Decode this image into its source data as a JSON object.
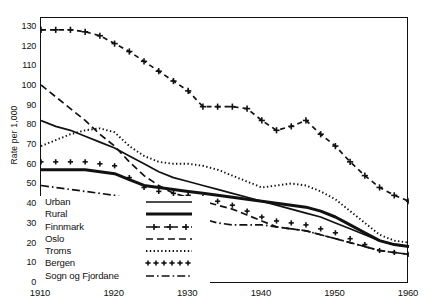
{
  "chart_data": {
    "type": "line",
    "title": "",
    "xlabel": "",
    "ylabel": "Rate per 1,000",
    "xlim": [
      1910,
      1960
    ],
    "ylim": [
      0,
      135
    ],
    "ytick_step": 10,
    "xtick_step": 10,
    "yticks": [
      0,
      10,
      20,
      30,
      40,
      50,
      60,
      70,
      80,
      90,
      100,
      110,
      120,
      130
    ],
    "xticks": [
      1910,
      1920,
      1930,
      1940,
      1950,
      1960
    ],
    "grid": false,
    "legend_position": "lower-left-inside",
    "series": [
      {
        "name": "Urban",
        "style": "solid-thin",
        "x": [
          1910,
          1912,
          1914,
          1916,
          1918,
          1920,
          1922,
          1924,
          1926,
          1928,
          1930,
          1932,
          1934,
          1936,
          1938,
          1940,
          1942,
          1944,
          1946,
          1948,
          1950,
          1952,
          1954,
          1956,
          1958,
          1960
        ],
        "values": [
          83,
          80,
          78,
          75,
          72,
          69,
          65,
          61,
          57,
          54,
          52,
          50,
          48,
          46,
          44,
          42,
          40,
          38,
          36,
          34,
          31,
          28,
          25,
          22,
          20,
          19
        ]
      },
      {
        "name": "Rural",
        "style": "solid-thick",
        "x": [
          1910,
          1912,
          1914,
          1916,
          1918,
          1920,
          1922,
          1924,
          1926,
          1928,
          1930,
          1932,
          1934,
          1936,
          1938,
          1940,
          1942,
          1944,
          1946,
          1948,
          1950,
          1952,
          1954,
          1956,
          1958,
          1960
        ],
        "values": [
          58,
          58,
          58,
          58,
          57,
          56,
          53,
          50,
          49,
          48,
          47,
          46,
          45,
          44,
          43,
          42,
          41,
          40,
          39,
          37,
          34,
          30,
          26,
          22,
          20,
          19
        ]
      },
      {
        "name": "Finnmark",
        "style": "dash-plus",
        "x": [
          1910,
          1912,
          1914,
          1916,
          1918,
          1920,
          1922,
          1924,
          1926,
          1928,
          1930,
          1932,
          1934,
          1936,
          1938,
          1940,
          1942,
          1944,
          1946,
          1948,
          1950,
          1952,
          1954,
          1956,
          1958,
          1960
        ],
        "values": [
          129,
          129,
          129,
          128,
          126,
          122,
          118,
          113,
          108,
          103,
          98,
          90,
          90,
          90,
          89,
          83,
          78,
          80,
          83,
          76,
          70,
          62,
          55,
          49,
          45,
          42
        ]
      },
      {
        "name": "Oslo",
        "style": "dashed",
        "x": [
          1910,
          1912,
          1914,
          1916,
          1918,
          1920,
          1922,
          1924,
          1926,
          1928,
          1930,
          1932,
          1934,
          1936,
          1938,
          1940,
          1942,
          1944,
          1946,
          1948,
          1950,
          1952,
          1954,
          1956,
          1958,
          1960
        ],
        "values": [
          101,
          95,
          89,
          83,
          76,
          70,
          62,
          55,
          50,
          46,
          44,
          42,
          40,
          38,
          35,
          32,
          29,
          28,
          27,
          25,
          23,
          21,
          19,
          17,
          16,
          15
        ]
      },
      {
        "name": "Troms",
        "style": "dotted",
        "x": [
          1910,
          1912,
          1914,
          1916,
          1918,
          1920,
          1922,
          1924,
          1926,
          1928,
          1930,
          1932,
          1934,
          1936,
          1938,
          1940,
          1942,
          1944,
          1946,
          1948,
          1950,
          1952,
          1954,
          1956,
          1958,
          1960
        ],
        "values": [
          70,
          73,
          76,
          78,
          79,
          77,
          70,
          65,
          62,
          61,
          61,
          60,
          58,
          55,
          52,
          49,
          50,
          51,
          50,
          47,
          43,
          37,
          31,
          25,
          22,
          21
        ]
      },
      {
        "name": "Bergen",
        "style": "plus-marks",
        "x": [
          1910,
          1912,
          1914,
          1916,
          1918,
          1920,
          1922,
          1924,
          1926,
          1928,
          1930,
          1932,
          1934,
          1936,
          1938,
          1940,
          1942,
          1944,
          1946,
          1948,
          1950,
          1952,
          1954,
          1956,
          1958,
          1960
        ],
        "values": [
          62,
          62,
          62,
          62,
          61,
          60,
          54,
          49,
          47,
          46,
          45,
          44,
          42,
          40,
          37,
          34,
          32,
          31,
          30,
          28,
          26,
          23,
          20,
          17,
          16,
          15
        ]
      },
      {
        "name": "Sogn og Fjordane",
        "style": "dash-dot",
        "x": [
          1910,
          1912,
          1914,
          1916,
          1918,
          1920,
          1922,
          1924,
          1926,
          1928,
          1930,
          1932,
          1934,
          1936,
          1938,
          1940,
          1942,
          1944,
          1946,
          1948,
          1950,
          1952,
          1954,
          1956,
          1958,
          1960
        ],
        "values": [
          50,
          49,
          48,
          47,
          46,
          45,
          43,
          41,
          39,
          37,
          35,
          33,
          31,
          30,
          30,
          30,
          29,
          28,
          27,
          25,
          23,
          21,
          19,
          17,
          16,
          15
        ]
      }
    ]
  },
  "legend": {
    "items": [
      {
        "label": "Urban",
        "style": "solid-thin"
      },
      {
        "label": "Rural",
        "style": "solid-thick"
      },
      {
        "label": "Finnmark",
        "style": "dash-plus"
      },
      {
        "label": "Oslo",
        "style": "dashed"
      },
      {
        "label": "Troms",
        "style": "dotted"
      },
      {
        "label": "Bergen",
        "style": "plus-marks"
      },
      {
        "label": "Sogn og Fjordane",
        "style": "dash-dot"
      }
    ]
  },
  "colors": {
    "ink": "#111111",
    "background": "#ffffff"
  }
}
